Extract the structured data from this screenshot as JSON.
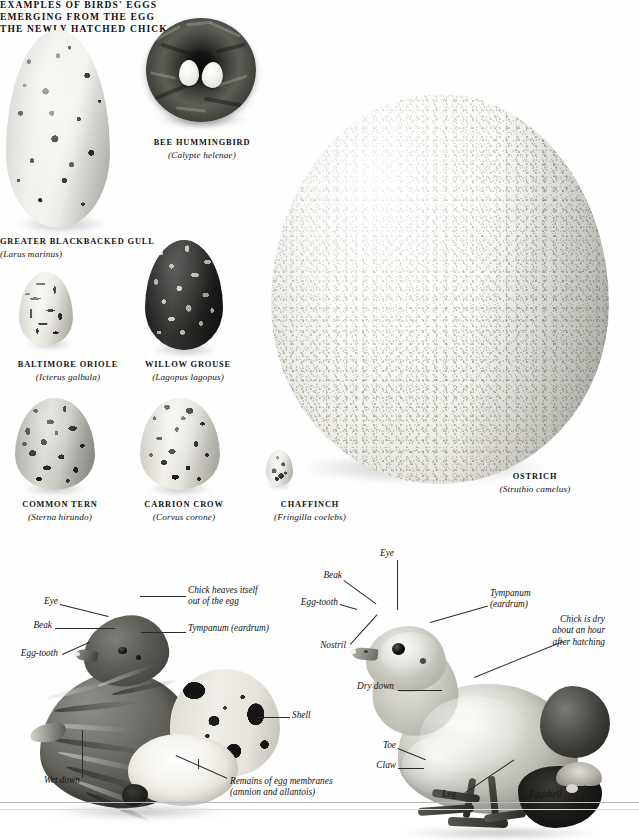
{
  "plate": {
    "title": "EXAMPLES OF BIRDS' EGGS",
    "section_emerging": "EMERGING FROM THE EGG",
    "section_hatched": "THE NEWLY HATCHED CHICK"
  },
  "specimens": [
    {
      "id": "greater-blackbacked-gull",
      "common": "GREATER BLACKBACKED GULL",
      "latin": "(Larus marinus)"
    },
    {
      "id": "bee-hummingbird",
      "common": "BEE HUMMINGBIRD",
      "latin": "(Calypte helenae)"
    },
    {
      "id": "baltimore-oriole",
      "common": "BALTIMORE ORIOLE",
      "latin": "(Icterus galbula)"
    },
    {
      "id": "willow-grouse",
      "common": "WILLOW GROUSE",
      "latin": "(Lagopus lagopus)"
    },
    {
      "id": "common-tern",
      "common": "COMMON TERN",
      "latin": "(Sterna hirundo)"
    },
    {
      "id": "carrion-crow",
      "common": "CARRION CROW",
      "latin": "(Corvus corone)"
    },
    {
      "id": "chaffinch",
      "common": "CHAFFINCH",
      "latin": "(Fringilla coelebs)"
    },
    {
      "id": "ostrich",
      "common": "OSTRICH",
      "latin": "(Struthio camelus)"
    }
  ],
  "emerging_labels": {
    "eye": "Eye",
    "beak": "Beak",
    "egg_tooth": "Egg-tooth",
    "wet_down": "Wet down",
    "chick_heaves_l1": "Chick heaves itself",
    "chick_heaves_l2": "out of  the egg",
    "tympanum": "Tympanum (eardrum)",
    "shell": "Shell",
    "remains_l1": "Remains of  egg membranes",
    "remains_l2": "(amnion and allantois)"
  },
  "hatched_labels": {
    "eye": "Eye",
    "beak": "Beak",
    "egg_tooth": "Egg-tooth",
    "nostril": "Nostril",
    "tympanum_l1": "Tympanum",
    "tympanum_l2": "(eardrum)",
    "dry_l1": "Chick is dry",
    "dry_l2": "about an hour",
    "dry_l3": "after hatching",
    "dry_down": "Dry down",
    "toe": "Toe",
    "claw": "Claw",
    "leg": "Leg",
    "eggshell": "Eggshell"
  },
  "colors": {
    "page_background": "#ffffff",
    "text": "#141414",
    "leader_line": "#2b2b2b",
    "rule": "#b9b9b9"
  }
}
